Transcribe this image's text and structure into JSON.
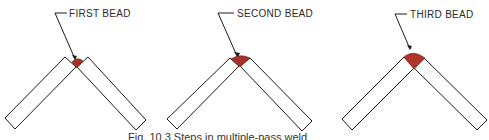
{
  "figure": {
    "caption": "Fig. 10.3  Steps in multiple-pass weld",
    "panels": [
      {
        "label": "FIRST BEAD"
      },
      {
        "label": "SECOND BEAD"
      },
      {
        "label": "THIRD BEAD"
      }
    ]
  },
  "colors": {
    "bead": "#a8302a",
    "outline": "#1a1a1a",
    "background": "#ffffff"
  }
}
